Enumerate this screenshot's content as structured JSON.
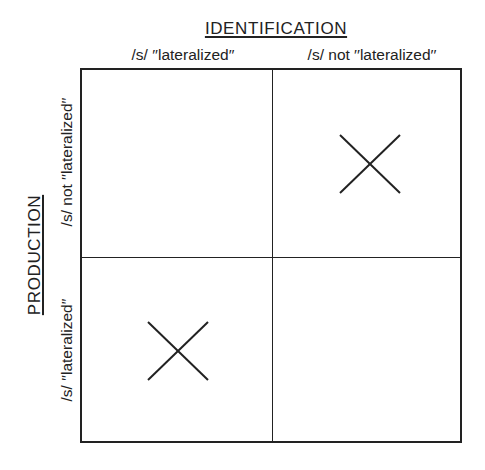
{
  "diagram": {
    "type": "2x2 matrix",
    "top_axis": {
      "title": "IDENTIFICATION",
      "columns": [
        {
          "label": "/s/ ′′lateralized′′"
        },
        {
          "label": "/s/ not ′′lateralized′′"
        }
      ]
    },
    "side_axis": {
      "title": "PRODUCTION",
      "rows": [
        {
          "label": "/s/ not ′′lateralized′′"
        },
        {
          "label": "/s/ ′′lateralized′′"
        }
      ]
    },
    "cells": [
      {
        "row": 0,
        "col": 0,
        "mark": ""
      },
      {
        "row": 0,
        "col": 1,
        "mark": "x-mark"
      },
      {
        "row": 1,
        "col": 0,
        "mark": "x-mark"
      },
      {
        "row": 1,
        "col": 1,
        "mark": ""
      }
    ],
    "colors": {
      "ink": "#222222",
      "background": "#ffffff"
    }
  }
}
